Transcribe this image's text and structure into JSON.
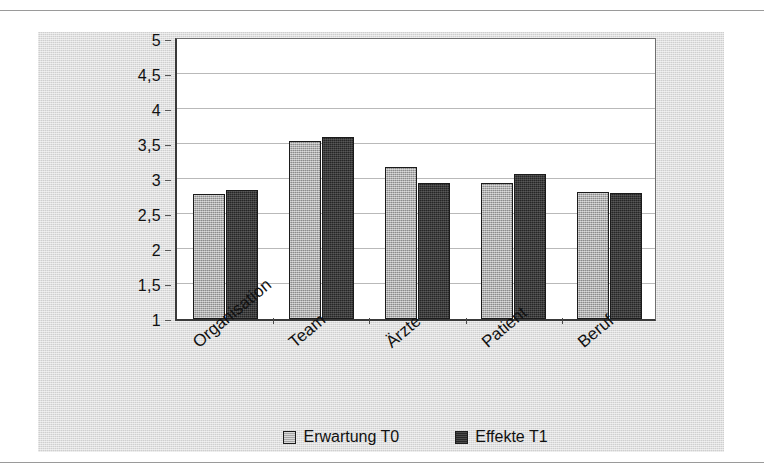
{
  "chart_data": {
    "type": "bar",
    "title": "",
    "xlabel": "",
    "ylabel": "",
    "categories": [
      "Organisation",
      "Team",
      "Ärzte",
      "Patient",
      "Beruf"
    ],
    "series": [
      {
        "name": "Erwartung T0",
        "color": "#a8a8a8",
        "values": [
          2.78,
          3.55,
          3.17,
          2.95,
          2.82
        ]
      },
      {
        "name": "Effekte T1",
        "color": "#262626",
        "values": [
          2.85,
          3.6,
          2.95,
          3.07,
          2.8
        ]
      }
    ],
    "ylim": [
      1,
      5
    ],
    "yticks": [
      1,
      1.5,
      2,
      2.5,
      3,
      3.5,
      4,
      4.5,
      5
    ],
    "ytick_labels": [
      "1",
      "1,5",
      "2",
      "2,5",
      "3",
      "3,5",
      "4",
      "4,5",
      "5"
    ],
    "grid": true,
    "legend_position": "bottom",
    "legend": [
      "Erwartung T0",
      "Effekte T1"
    ],
    "background_color": "#cfcfcf",
    "plot_background_color": "#ffffff"
  }
}
